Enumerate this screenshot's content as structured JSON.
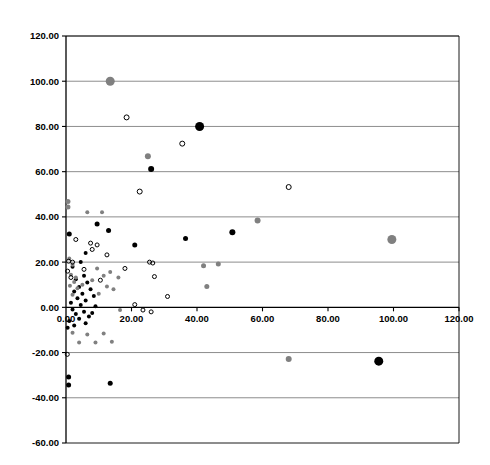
{
  "chart_data": {
    "type": "scatter",
    "title": "",
    "subtitle": "",
    "xlabel": "",
    "ylabel": "",
    "xlim": [
      0,
      120
    ],
    "ylim": [
      -60,
      120
    ],
    "xticks": [
      0,
      20,
      40,
      60,
      80,
      100,
      120
    ],
    "yticks": [
      -60,
      -40,
      -20,
      0,
      20,
      40,
      60,
      80,
      100,
      120
    ],
    "xticklabels": [
      "0.00",
      "20.00",
      "40.00",
      "60.00",
      "80.00",
      "100.00",
      "120.00"
    ],
    "yticklabels": [
      "-60.00",
      "-40.00",
      "-20.00",
      "0.00",
      "20.00",
      "40.00",
      "60.00",
      "80.00",
      "100.00",
      "120.00"
    ],
    "grid": "horizontal",
    "grid_color": "#808080",
    "axis_color": "#000000",
    "legend": "none",
    "xaxis_line_at_y": 0,
    "series": [
      {
        "name": "black-filled",
        "marker": "filled-circle",
        "color": "#000000",
        "points": [
          {
            "x": 40.8,
            "y": 80.0,
            "size": 9
          },
          {
            "x": 26.0,
            "y": 61.2,
            "size": 6
          },
          {
            "x": 50.8,
            "y": 33.2,
            "size": 6
          },
          {
            "x": 36.5,
            "y": 30.4,
            "size": 5
          },
          {
            "x": 21.0,
            "y": 27.6,
            "size": 5
          },
          {
            "x": 9.5,
            "y": 36.8,
            "size": 5
          },
          {
            "x": 13.0,
            "y": 34.0,
            "size": 5
          },
          {
            "x": 1.0,
            "y": 32.4,
            "size": 5
          },
          {
            "x": 6.0,
            "y": 24.0,
            "size": 4
          },
          {
            "x": 4.5,
            "y": 20.0,
            "size": 4
          },
          {
            "x": 2.0,
            "y": 18.0,
            "size": 4
          },
          {
            "x": 5.5,
            "y": 14.0,
            "size": 4
          },
          {
            "x": 3.0,
            "y": 12.4,
            "size": 4
          },
          {
            "x": 6.5,
            "y": 11.0,
            "size": 4
          },
          {
            "x": 4.0,
            "y": 9.0,
            "size": 4
          },
          {
            "x": 7.5,
            "y": 8.0,
            "size": 4
          },
          {
            "x": 2.5,
            "y": 7.0,
            "size": 4
          },
          {
            "x": 5.0,
            "y": 6.0,
            "size": 4
          },
          {
            "x": 8.5,
            "y": 5.0,
            "size": 4
          },
          {
            "x": 3.5,
            "y": 4.0,
            "size": 4
          },
          {
            "x": 6.0,
            "y": 3.0,
            "size": 4
          },
          {
            "x": 1.5,
            "y": 2.0,
            "size": 4
          },
          {
            "x": 4.5,
            "y": 1.0,
            "size": 4
          },
          {
            "x": 9.0,
            "y": 0.5,
            "size": 4
          },
          {
            "x": 2.0,
            "y": -1.0,
            "size": 4
          },
          {
            "x": 5.5,
            "y": -2.0,
            "size": 4
          },
          {
            "x": 3.0,
            "y": -3.0,
            "size": 4
          },
          {
            "x": 7.0,
            "y": -4.0,
            "size": 4
          },
          {
            "x": 4.0,
            "y": -5.0,
            "size": 4
          },
          {
            "x": 1.0,
            "y": -6.0,
            "size": 4
          },
          {
            "x": 6.0,
            "y": -7.0,
            "size": 4
          },
          {
            "x": 2.5,
            "y": -8.0,
            "size": 4
          },
          {
            "x": 8.0,
            "y": -2.5,
            "size": 4
          },
          {
            "x": 0.5,
            "y": -9.0,
            "size": 4
          },
          {
            "x": 95.5,
            "y": -23.8,
            "size": 9
          },
          {
            "x": 13.5,
            "y": -33.6,
            "size": 5
          },
          {
            "x": 0.8,
            "y": -30.8,
            "size": 5
          },
          {
            "x": 0.8,
            "y": -34.4,
            "size": 5
          }
        ]
      },
      {
        "name": "gray-filled",
        "marker": "filled-circle",
        "color": "#808080",
        "points": [
          {
            "x": 13.5,
            "y": 100.0,
            "size": 9
          },
          {
            "x": 25.0,
            "y": 66.8,
            "size": 6
          },
          {
            "x": 99.5,
            "y": 30.0,
            "size": 9
          },
          {
            "x": 58.5,
            "y": 38.4,
            "size": 6
          },
          {
            "x": 42.0,
            "y": 18.4,
            "size": 5
          },
          {
            "x": 46.5,
            "y": 19.2,
            "size": 5
          },
          {
            "x": 43.0,
            "y": 9.2,
            "size": 5
          },
          {
            "x": 0.6,
            "y": 46.8,
            "size": 5
          },
          {
            "x": 0.6,
            "y": 44.4,
            "size": 5
          },
          {
            "x": 6.5,
            "y": 42.0,
            "size": 4
          },
          {
            "x": 11.0,
            "y": 42.0,
            "size": 4
          },
          {
            "x": 1.0,
            "y": 21.6,
            "size": 4
          },
          {
            "x": 2.0,
            "y": 18.8,
            "size": 4
          },
          {
            "x": 9.5,
            "y": 17.2,
            "size": 4
          },
          {
            "x": 1.5,
            "y": 14.4,
            "size": 4
          },
          {
            "x": 3.0,
            "y": 13.2,
            "size": 4
          },
          {
            "x": 11.5,
            "y": 14.0,
            "size": 4
          },
          {
            "x": 13.5,
            "y": 15.6,
            "size": 4
          },
          {
            "x": 16.0,
            "y": 13.2,
            "size": 4
          },
          {
            "x": 8.0,
            "y": 12.0,
            "size": 4
          },
          {
            "x": 2.5,
            "y": 11.2,
            "size": 4
          },
          {
            "x": 5.0,
            "y": 10.0,
            "size": 4
          },
          {
            "x": 12.5,
            "y": 9.2,
            "size": 4
          },
          {
            "x": 14.5,
            "y": 8.0,
            "size": 4
          },
          {
            "x": 1.2,
            "y": 9.6,
            "size": 4
          },
          {
            "x": 3.5,
            "y": 8.4,
            "size": 4
          },
          {
            "x": 10.0,
            "y": 6.0,
            "size": 4
          },
          {
            "x": 2.0,
            "y": 5.6,
            "size": 4
          },
          {
            "x": 16.5,
            "y": -1.2,
            "size": 4
          },
          {
            "x": 2.0,
            "y": -11.2,
            "size": 4
          },
          {
            "x": 6.5,
            "y": -12.0,
            "size": 4
          },
          {
            "x": 11.5,
            "y": -11.6,
            "size": 4
          },
          {
            "x": 4.0,
            "y": -15.6,
            "size": 4
          },
          {
            "x": 9.0,
            "y": -15.6,
            "size": 4
          },
          {
            "x": 14.0,
            "y": -15.2,
            "size": 4
          },
          {
            "x": 68.0,
            "y": -22.8,
            "size": 6
          }
        ]
      },
      {
        "name": "open-circle",
        "marker": "open-circle",
        "color": "#000000",
        "points": [
          {
            "x": 18.5,
            "y": 84.0,
            "size": 5
          },
          {
            "x": 35.5,
            "y": 72.4,
            "size": 5
          },
          {
            "x": 22.5,
            "y": 51.2,
            "size": 5
          },
          {
            "x": 68.0,
            "y": 53.2,
            "size": 5
          },
          {
            "x": 3.0,
            "y": 30.0,
            "size": 4
          },
          {
            "x": 7.5,
            "y": 28.4,
            "size": 4
          },
          {
            "x": 9.5,
            "y": 27.6,
            "size": 4
          },
          {
            "x": 8.0,
            "y": 25.6,
            "size": 4
          },
          {
            "x": 12.5,
            "y": 23.2,
            "size": 4
          },
          {
            "x": 0.8,
            "y": 20.4,
            "size": 4
          },
          {
            "x": 2.0,
            "y": 20.0,
            "size": 4
          },
          {
            "x": 18.0,
            "y": 17.2,
            "size": 4
          },
          {
            "x": 25.5,
            "y": 20.0,
            "size": 4
          },
          {
            "x": 26.5,
            "y": 19.6,
            "size": 4
          },
          {
            "x": 0.5,
            "y": 16.0,
            "size": 4
          },
          {
            "x": 5.5,
            "y": 16.8,
            "size": 4
          },
          {
            "x": 27.0,
            "y": 13.6,
            "size": 4
          },
          {
            "x": 1.5,
            "y": 13.2,
            "size": 4
          },
          {
            "x": 10.5,
            "y": 12.0,
            "size": 4
          },
          {
            "x": 31.0,
            "y": 4.8,
            "size": 4
          },
          {
            "x": 21.0,
            "y": 1.2,
            "size": 4
          },
          {
            "x": 23.5,
            "y": -1.2,
            "size": 4
          },
          {
            "x": 26.0,
            "y": -2.0,
            "size": 4
          },
          {
            "x": 0.4,
            "y": -20.8,
            "size": 4
          }
        ]
      }
    ]
  }
}
